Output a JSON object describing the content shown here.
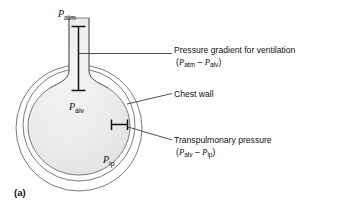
{
  "figure": {
    "panel_caption": "(a)",
    "diagram_labels": [
      {
        "name": "atmospheric-pressure",
        "symbol": "P",
        "subscript": "atm"
      },
      {
        "name": "alveolar-pressure",
        "symbol": "P",
        "subscript": "alv"
      },
      {
        "name": "intrapleural-pressure",
        "symbol": "P",
        "subscript": "ip"
      }
    ],
    "callouts": [
      {
        "name": "pressure-gradient",
        "text": "Pressure gradient for ventilation",
        "formula_open": "(",
        "formula_symbol_1": "P",
        "formula_sub_1": "atm",
        "formula_operator": "–",
        "formula_symbol_2": "P",
        "formula_sub_2": "alv",
        "formula_close": ")"
      },
      {
        "name": "chest-wall",
        "text": "Chest wall"
      },
      {
        "name": "transpulmonary-pressure",
        "text": "Transpulmonary pressure",
        "formula_open": "(",
        "formula_symbol_1": "P",
        "formula_sub_1": "alv",
        "formula_operator": "–",
        "formula_symbol_2": "P",
        "formula_sub_2": "ip",
        "formula_close": ")"
      }
    ],
    "colors": {
      "background": "#ffffff",
      "outline": "#6b6b6b",
      "lung_fill": "#ececec",
      "pleural_fill": "#ffffff",
      "text": "#111111",
      "measure_bar": "#111111",
      "leader_line": "#3c3c3c"
    }
  }
}
